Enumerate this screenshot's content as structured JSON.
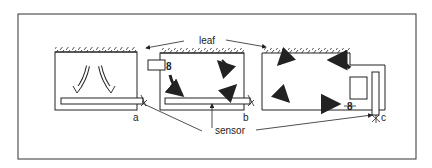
{
  "diagram": {
    "labels": {
      "leaf": "leaf",
      "sensor": "sensor",
      "a": "a",
      "b": "b",
      "c": "c"
    },
    "panels": [
      {
        "id": "a",
        "description": "enclosure with sensor plate at bottom, downward curved airflow arrows"
      },
      {
        "id": "b",
        "description": "enclosure with side-mounted fan, circulating airflow arrows, sensor plate at bottom"
      },
      {
        "id": "c",
        "description": "enclosure with fan in side compartment and vertical sensor, circulating airflow arrows"
      }
    ],
    "colors": {
      "ink": "#222222",
      "background": "#ffffff"
    }
  }
}
